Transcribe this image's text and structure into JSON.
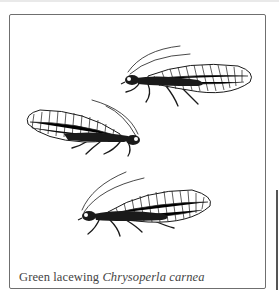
{
  "illustration": {
    "subject": "green-lacewing",
    "count": 3,
    "ink_color": "#1a1a1a",
    "frame_color": "#6f6f6f"
  },
  "caption": {
    "common_name": "Green lacewing",
    "scientific_name": "Chrysoperla carnea"
  }
}
